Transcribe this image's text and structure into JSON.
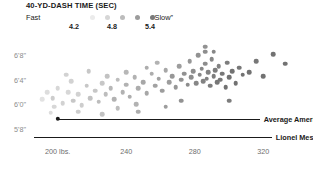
{
  "chart_data": {
    "type": "scatter",
    "title": "40-YD-DASH TIME (SEC)",
    "xlabel": "",
    "ylabel": "",
    "grid": false,
    "xlim": [
      185,
      345
    ],
    "ylim": [
      66,
      82
    ],
    "xticks": [
      200,
      240,
      280,
      320
    ],
    "xticklabels": [
      "200 lbs.",
      "240",
      "280",
      "320"
    ],
    "yticks": [
      80,
      76,
      72,
      68
    ],
    "yticklabels": [
      "6'8\"",
      "6'4\"",
      "6'0\"",
      "5'8\""
    ],
    "colorbar": {
      "label_low": "Fast",
      "label_high": "“Slow”",
      "ticks": [
        "4.2",
        "4.8",
        "5.4"
      ],
      "swatches": [
        "#e9e9e9",
        "#d2d2d2",
        "#b4b4b4",
        "#949494",
        "#6f6f6f"
      ]
    },
    "encoding": {
      "x": "weight_lbs",
      "y": "height_inches",
      "color": "forty_yard_dash_sec"
    },
    "annotations": [
      {
        "name": "average-american-male",
        "text": "Average American male (>6.0 sec)",
        "x_start": 200,
        "x_end": 318,
        "y": 69.6
      },
      {
        "name": "lionel-messi",
        "text": "Lionel Messi (4.5 sec estimate)",
        "x_start": 186,
        "x_end": 325,
        "y": 66.6
      }
    ],
    "points": [
      {
        "x": 197,
        "y": 73.0,
        "t": 4.55
      },
      {
        "x": 203,
        "y": 72.2,
        "t": 4.5
      },
      {
        "x": 206,
        "y": 74.0,
        "t": 4.45
      },
      {
        "x": 209,
        "y": 72.6,
        "t": 4.6
      },
      {
        "x": 212,
        "y": 73.6,
        "t": 4.5
      },
      {
        "x": 214,
        "y": 71.8,
        "t": 4.55
      },
      {
        "x": 217,
        "y": 75.0,
        "t": 4.6
      },
      {
        "x": 219,
        "y": 73.0,
        "t": 4.65
      },
      {
        "x": 222,
        "y": 74.2,
        "t": 4.6
      },
      {
        "x": 224,
        "y": 72.4,
        "t": 4.7
      },
      {
        "x": 226,
        "y": 75.4,
        "t": 4.6
      },
      {
        "x": 228,
        "y": 73.6,
        "t": 4.7
      },
      {
        "x": 231,
        "y": 74.6,
        "t": 4.75
      },
      {
        "x": 233,
        "y": 72.8,
        "t": 4.8
      },
      {
        "x": 235,
        "y": 76.0,
        "t": 4.7
      },
      {
        "x": 238,
        "y": 74.0,
        "t": 4.8
      },
      {
        "x": 240,
        "y": 75.2,
        "t": 4.8
      },
      {
        "x": 242,
        "y": 73.2,
        "t": 4.85
      },
      {
        "x": 245,
        "y": 76.4,
        "t": 4.8
      },
      {
        "x": 247,
        "y": 74.6,
        "t": 4.85
      },
      {
        "x": 250,
        "y": 75.6,
        "t": 4.9
      },
      {
        "x": 252,
        "y": 73.8,
        "t": 4.9
      },
      {
        "x": 255,
        "y": 77.0,
        "t": 4.85
      },
      {
        "x": 257,
        "y": 75.0,
        "t": 4.95
      },
      {
        "x": 259,
        "y": 76.2,
        "t": 4.95
      },
      {
        "x": 261,
        "y": 74.2,
        "t": 5.0
      },
      {
        "x": 263,
        "y": 77.6,
        "t": 4.9
      },
      {
        "x": 265,
        "y": 75.6,
        "t": 5.0
      },
      {
        "x": 267,
        "y": 76.6,
        "t": 5.05
      },
      {
        "x": 269,
        "y": 74.8,
        "t": 5.05
      },
      {
        "x": 271,
        "y": 78.2,
        "t": 5.0
      },
      {
        "x": 272,
        "y": 76.0,
        "t": 5.1
      },
      {
        "x": 274,
        "y": 77.0,
        "t": 5.1
      },
      {
        "x": 276,
        "y": 75.2,
        "t": 5.15
      },
      {
        "x": 277,
        "y": 79.0,
        "t": 5.05
      },
      {
        "x": 278,
        "y": 76.4,
        "t": 5.15
      },
      {
        "x": 279,
        "y": 77.4,
        "t": 5.15
      },
      {
        "x": 281,
        "y": 75.4,
        "t": 5.2
      },
      {
        "x": 282,
        "y": 80.0,
        "t": 5.1
      },
      {
        "x": 283,
        "y": 76.8,
        "t": 5.2
      },
      {
        "x": 284,
        "y": 77.8,
        "t": 5.2
      },
      {
        "x": 285,
        "y": 75.8,
        "t": 5.25
      },
      {
        "x": 286,
        "y": 78.6,
        "t": 5.15
      },
      {
        "x": 287,
        "y": 76.2,
        "t": 5.25
      },
      {
        "x": 288,
        "y": 77.2,
        "t": 5.25
      },
      {
        "x": 289,
        "y": 75.0,
        "t": 5.3
      },
      {
        "x": 290,
        "y": 79.4,
        "t": 5.2
      },
      {
        "x": 291,
        "y": 76.6,
        "t": 5.3
      },
      {
        "x": 292,
        "y": 77.6,
        "t": 5.3
      },
      {
        "x": 293,
        "y": 75.6,
        "t": 5.35
      },
      {
        "x": 294,
        "y": 78.2,
        "t": 5.25
      },
      {
        "x": 295,
        "y": 76.0,
        "t": 5.35
      },
      {
        "x": 296,
        "y": 77.0,
        "t": 5.35
      },
      {
        "x": 298,
        "y": 74.8,
        "t": 5.4
      },
      {
        "x": 299,
        "y": 78.8,
        "t": 5.3
      },
      {
        "x": 300,
        "y": 76.4,
        "t": 5.4
      },
      {
        "x": 302,
        "y": 77.4,
        "t": 5.4
      },
      {
        "x": 304,
        "y": 75.4,
        "t": 5.4
      },
      {
        "x": 306,
        "y": 78.0,
        "t": 5.35
      },
      {
        "x": 308,
        "y": 76.8,
        "t": 5.4
      },
      {
        "x": 312,
        "y": 77.2,
        "t": 5.4
      },
      {
        "x": 316,
        "y": 79.0,
        "t": 5.35
      },
      {
        "x": 320,
        "y": 76.6,
        "t": 5.4
      },
      {
        "x": 326,
        "y": 80.2,
        "t": 5.4
      },
      {
        "x": 333,
        "y": 78.6,
        "t": 5.4
      },
      {
        "x": 286,
        "y": 81.4,
        "t": 5.1
      },
      {
        "x": 286,
        "y": 80.6,
        "t": 5.15
      },
      {
        "x": 291,
        "y": 80.6,
        "t": 5.2
      },
      {
        "x": 258,
        "y": 78.8,
        "t": 4.8
      },
      {
        "x": 300,
        "y": 72.6,
        "t": 5.3
      },
      {
        "x": 272,
        "y": 72.6,
        "t": 5.1
      },
      {
        "x": 246,
        "y": 72.0,
        "t": 4.8
      },
      {
        "x": 235,
        "y": 71.4,
        "t": 4.7
      },
      {
        "x": 263,
        "y": 71.6,
        "t": 5.0
      },
      {
        "x": 252,
        "y": 78.0,
        "t": 4.85
      },
      {
        "x": 240,
        "y": 77.2,
        "t": 4.75
      },
      {
        "x": 229,
        "y": 76.6,
        "t": 4.65
      },
      {
        "x": 208,
        "y": 75.8,
        "t": 4.5
      },
      {
        "x": 200,
        "y": 74.6,
        "t": 4.45
      },
      {
        "x": 194,
        "y": 74.0,
        "t": 4.4
      },
      {
        "x": 191,
        "y": 72.8,
        "t": 4.35
      },
      {
        "x": 198,
        "y": 71.6,
        "t": 4.45
      },
      {
        "x": 212,
        "y": 70.8,
        "t": 4.55
      },
      {
        "x": 226,
        "y": 70.4,
        "t": 4.65
      },
      {
        "x": 205,
        "y": 76.8,
        "t": 4.5
      },
      {
        "x": 218,
        "y": 77.4,
        "t": 4.6
      },
      {
        "x": 247,
        "y": 70.8,
        "t": 4.85
      },
      {
        "x": 196,
        "y": 70.6,
        "t": 4.4
      }
    ]
  },
  "legend": {
    "ticks": [
      {
        "label": "4.2",
        "x": 48
      },
      {
        "label": "4.8",
        "x": 86
      },
      {
        "label": "5.4",
        "x": 124
      }
    ],
    "dots": [
      {
        "x": 64,
        "color": "#ebebeb"
      },
      {
        "x": 79,
        "color": "#d6d6d6"
      },
      {
        "x": 94,
        "color": "#bcbcbc"
      },
      {
        "x": 109,
        "color": "#9c9c9c"
      },
      {
        "x": 124,
        "color": "#7a7a7a"
      }
    ]
  }
}
